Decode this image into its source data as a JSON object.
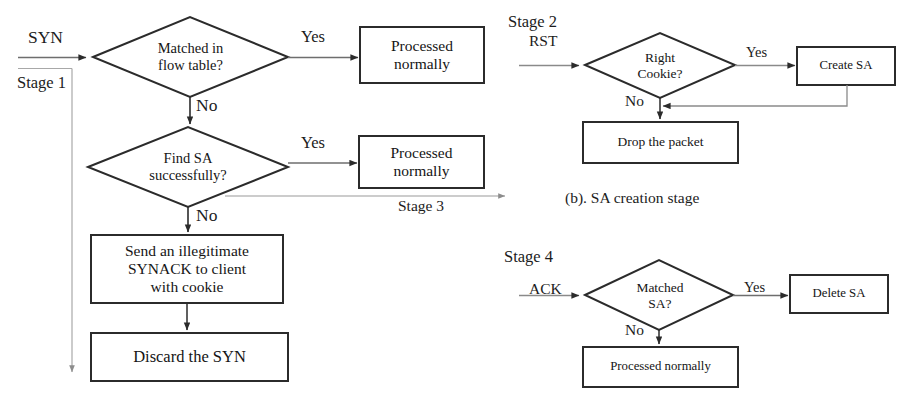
{
  "figure": {
    "kind": "flowchart",
    "stages": [
      "Stage 1",
      "Stage 2",
      "Stage 3",
      "Stage 4"
    ],
    "captions": [
      "(b). SA creation stage"
    ]
  },
  "panel_a": {
    "stage_label": "Stage 1",
    "input_label": "SYN",
    "decision1": "Matched in\nflow table?",
    "decision1_yes": "Yes",
    "decision1_no": "No",
    "box_processed_1": "Processed\nnormally",
    "decision2": "Find SA\nsuccessfully?",
    "decision2_yes": "Yes",
    "decision2_no": "No",
    "box_processed_2": "Processed\nnormally",
    "stage3_label": "Stage 3",
    "box_send_synack": "Send an illegitimate\nSYNACK to client\nwith cookie",
    "box_discard": "Discard the SYN"
  },
  "panel_b": {
    "stage_label": "Stage 2",
    "input_label": "RST",
    "decision": "Right\nCookie?",
    "yes_label": "Yes",
    "no_label": "No",
    "box_create_sa": "Create SA",
    "box_drop": "Drop the packet",
    "caption": "(b). SA creation stage"
  },
  "panel_c": {
    "stage_label": "Stage 4",
    "input_label": "ACK",
    "decision": "Matched\nSA?",
    "yes_label": "Yes",
    "no_label": "No",
    "box_delete_sa": "Delete SA",
    "box_processed": "Processed normally"
  },
  "colors": {
    "stroke": "#2b2b2b",
    "thin_stroke": "#6e6e6e",
    "background": "#ffffff",
    "text": "#151515"
  }
}
